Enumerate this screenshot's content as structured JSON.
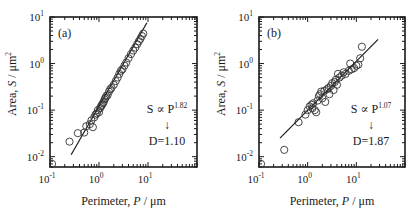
{
  "chart_data": [
    {
      "type": "scatter",
      "panel_label": "(a)",
      "title": "",
      "xlabel": "Perimeter, P / μm",
      "ylabel": "Area, S / μm²",
      "xscale": "log",
      "yscale": "log",
      "xlim": [
        0.1,
        100
      ],
      "ylim": [
        0.006,
        10
      ],
      "x_ticks": [
        "10^-1",
        "10^0",
        "10^1"
      ],
      "y_ticks": [
        "10^-2",
        "10^-1",
        "10^0",
        "10^1"
      ],
      "grid": false,
      "annotation": {
        "relation": "S ∝ P^1.82",
        "arrow": "↓",
        "result": "D=1.10"
      },
      "fit_line": {
        "exponent": 1.82,
        "x_range": [
          0.27,
          9.5
        ],
        "y_range": [
          0.011,
          7.5
        ]
      },
      "series": [
        {
          "name": "data",
          "marker": "open-circle",
          "points": [
            [
              0.11,
              0.007
            ],
            [
              0.25,
              0.021
            ],
            [
              0.37,
              0.032
            ],
            [
              0.5,
              0.033
            ],
            [
              0.55,
              0.045
            ],
            [
              0.65,
              0.05
            ],
            [
              0.75,
              0.043
            ],
            [
              0.7,
              0.06
            ],
            [
              0.8,
              0.07
            ],
            [
              0.85,
              0.08
            ],
            [
              0.9,
              0.085
            ],
            [
              0.95,
              0.1
            ],
            [
              1.0,
              0.09
            ],
            [
              1.05,
              0.11
            ],
            [
              1.1,
              0.12
            ],
            [
              1.15,
              0.13
            ],
            [
              1.2,
              0.14
            ],
            [
              1.25,
              0.15
            ],
            [
              1.3,
              0.17
            ],
            [
              1.35,
              0.18
            ],
            [
              1.4,
              0.2
            ],
            [
              1.5,
              0.21
            ],
            [
              1.6,
              0.25
            ],
            [
              1.7,
              0.28
            ],
            [
              1.8,
              0.3
            ],
            [
              2.0,
              0.35
            ],
            [
              2.2,
              0.42
            ],
            [
              2.4,
              0.5
            ],
            [
              2.6,
              0.6
            ],
            [
              2.8,
              0.7
            ],
            [
              3.0,
              0.75
            ],
            [
              3.3,
              0.9
            ],
            [
              3.6,
              1.05
            ],
            [
              4.0,
              1.3
            ],
            [
              4.5,
              1.6
            ],
            [
              5.0,
              1.9
            ],
            [
              5.5,
              2.2
            ],
            [
              6.0,
              2.6
            ],
            [
              6.5,
              3.0
            ],
            [
              7.0,
              3.4
            ],
            [
              7.5,
              3.9
            ],
            [
              8.0,
              4.4
            ]
          ]
        }
      ]
    },
    {
      "type": "scatter",
      "panel_label": "(b)",
      "title": "",
      "xlabel": "Perimeter, P / μm",
      "ylabel": "Area, S / μm²",
      "xscale": "log",
      "yscale": "log",
      "xlim": [
        0.1,
        100
      ],
      "ylim": [
        0.006,
        10
      ],
      "x_ticks": [
        "10^-1",
        "10^0",
        "10^1"
      ],
      "y_ticks": [
        "10^-2",
        "10^-1",
        "10^0",
        "10^1"
      ],
      "grid": false,
      "annotation": {
        "relation": "S ∝ P^1.07",
        "arrow": "↓",
        "result": "D=1.87"
      },
      "fit_line": {
        "exponent": 1.07,
        "x_range": [
          0.27,
          28
        ],
        "y_range": [
          0.025,
          3.3
        ]
      },
      "series": [
        {
          "name": "data",
          "marker": "open-circle",
          "points": [
            [
              0.11,
              0.007
            ],
            [
              0.33,
              0.014
            ],
            [
              0.65,
              0.055
            ],
            [
              0.9,
              0.08
            ],
            [
              1.0,
              0.1
            ],
            [
              1.1,
              0.12
            ],
            [
              1.2,
              0.13
            ],
            [
              1.25,
              0.11
            ],
            [
              1.3,
              0.14
            ],
            [
              1.4,
              0.1
            ],
            [
              1.5,
              0.09
            ],
            [
              1.6,
              0.16
            ],
            [
              1.7,
              0.2
            ],
            [
              1.8,
              0.22
            ],
            [
              1.9,
              0.25
            ],
            [
              2.0,
              0.18
            ],
            [
              2.2,
              0.26
            ],
            [
              2.3,
              0.15
            ],
            [
              2.5,
              0.28
            ],
            [
              2.7,
              0.3
            ],
            [
              2.8,
              0.22
            ],
            [
              3.0,
              0.33
            ],
            [
              3.2,
              0.38
            ],
            [
              3.4,
              0.27
            ],
            [
              3.6,
              0.4
            ],
            [
              3.8,
              0.45
            ],
            [
              4.0,
              0.35
            ],
            [
              4.2,
              0.6
            ],
            [
              4.5,
              0.5
            ],
            [
              5.0,
              0.55
            ],
            [
              5.5,
              0.65
            ],
            [
              6.0,
              0.6
            ],
            [
              7.0,
              0.7
            ],
            [
              7.5,
              1.0
            ],
            [
              8.0,
              0.75
            ],
            [
              9.0,
              0.8
            ],
            [
              10.0,
              0.9
            ],
            [
              11.0,
              0.95
            ],
            [
              12.0,
              1.3
            ],
            [
              13.0,
              2.3
            ]
          ]
        }
      ]
    }
  ],
  "panels": [
    {
      "label": "(a)",
      "relation_prefix": "S ∝ P",
      "exponent": "1.82",
      "arrow": "↓",
      "result": "D=1.10"
    },
    {
      "label": "(b)",
      "relation_prefix": "S ∝ P",
      "exponent": "1.07",
      "arrow": "↓",
      "result": "D=1.87"
    }
  ],
  "axes": {
    "xlabel_main": "Perimeter, ",
    "xlabel_var": "P",
    "xlabel_unit": " / μm",
    "ylabel_main": "Area, ",
    "ylabel_var": "S",
    "ylabel_unit": " / μm",
    "ylabel_unit_sup": "2",
    "tick_base": "10",
    "x_exponents": [
      "-1",
      "0",
      "1"
    ],
    "y_exponents": [
      "1",
      "0",
      "-1",
      "-2"
    ]
  },
  "colors": {
    "ink": "#1a1a1a",
    "marker": "#333333",
    "background": "#ffffff"
  }
}
